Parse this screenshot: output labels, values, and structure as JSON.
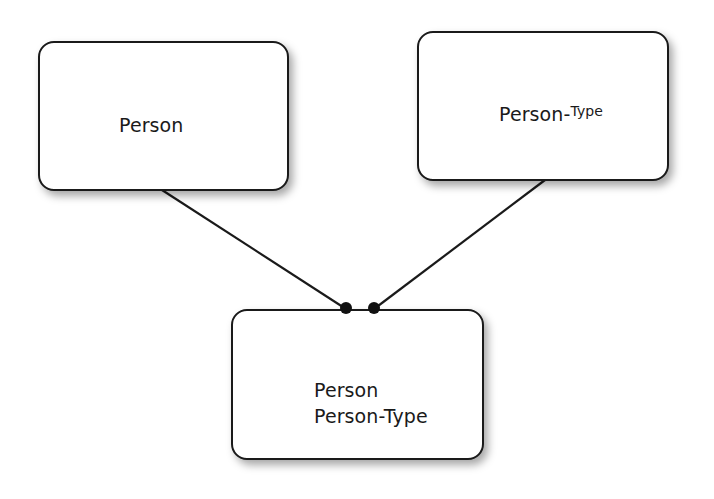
{
  "diagram": {
    "type": "entity-relationship",
    "entities": [
      {
        "id": "person",
        "label": "Person"
      },
      {
        "id": "person_type",
        "label_main": "Person-",
        "label_sup": "Type"
      },
      {
        "id": "person_person_type",
        "lines": [
          "Person",
          "Person-Type"
        ]
      }
    ],
    "relationships": [
      {
        "from": "person",
        "to": "person_person_type",
        "end_marker": "filled-dot"
      },
      {
        "from": "person_type",
        "to": "person_person_type",
        "end_marker": "filled-dot"
      }
    ],
    "colors": {
      "stroke": "#1a1a1a",
      "fill": "#ffffff",
      "background": "#ffffff"
    }
  }
}
